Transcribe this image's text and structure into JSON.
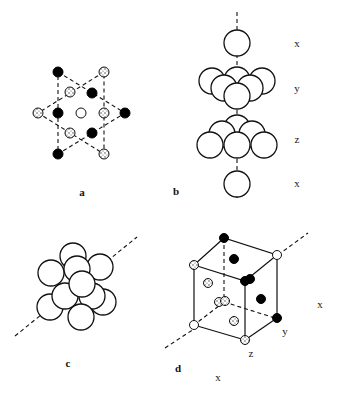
{
  "figure": {
    "panels": [
      {
        "id": "a",
        "label": "a",
        "description": "hexagram projection of close-packed layers"
      },
      {
        "id": "b",
        "label": "b",
        "description": "stacking sequence of close-packed layers",
        "layer_labels": [
          "x",
          "y",
          "z",
          "x"
        ]
      },
      {
        "id": "c",
        "label": "c",
        "description": "cluster of spheres along stacking axis"
      },
      {
        "id": "d",
        "label": "d",
        "description": "face-centered cubic unit cell with layer positions",
        "axis_labels": {
          "y": "y",
          "z": "z",
          "x_bottom": "x",
          "x_right": "x"
        }
      }
    ],
    "legend": {
      "atom_types": [
        "black",
        "speckled",
        "white"
      ]
    },
    "colors": {
      "line": "#111111",
      "background": "#ffffff",
      "black_atom": "#000000",
      "white_atom": "#ffffff"
    }
  }
}
